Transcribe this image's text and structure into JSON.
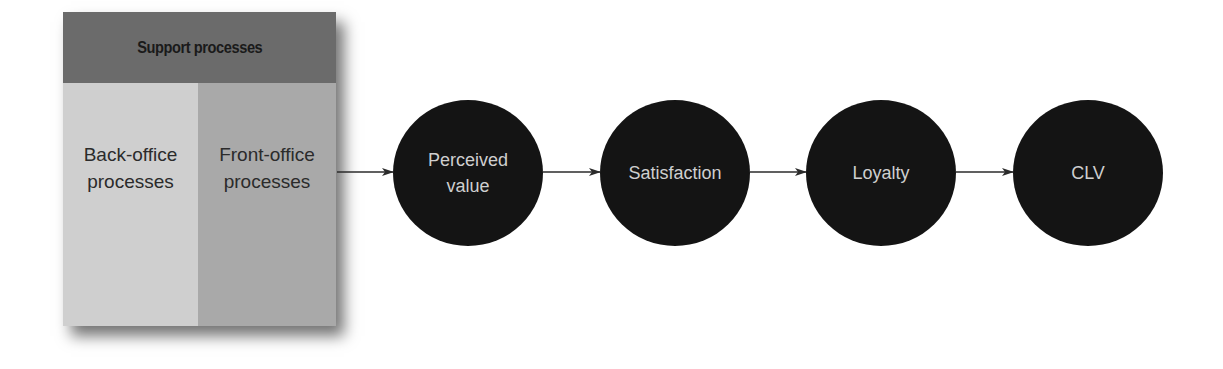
{
  "diagram": {
    "support_box": {
      "header": "Support processes",
      "columns": [
        {
          "line1": "Back-office",
          "line2": "processes"
        },
        {
          "line1": "Front-office",
          "line2": "processes"
        }
      ]
    },
    "nodes": [
      {
        "line1": "Perceived",
        "line2": "value"
      },
      {
        "line1": "Satisfaction",
        "line2": ""
      },
      {
        "line1": "Loyalty",
        "line2": ""
      },
      {
        "line1": "CLV",
        "line2": ""
      }
    ],
    "flow": [
      "Support processes box",
      "Perceived value",
      "Satisfaction",
      "Loyalty",
      "CLV"
    ],
    "colors": {
      "header": "#6b6b6b",
      "back_office": "#cfcfcf",
      "front_office": "#a9a9a9",
      "node_fill": "#141414",
      "node_text": "#cfcfcf",
      "arrow": "#2b2b2b"
    }
  }
}
